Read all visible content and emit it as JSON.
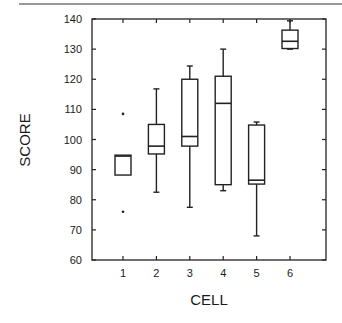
{
  "chart_data": {
    "type": "box",
    "title": "",
    "xlabel": "CELL",
    "ylabel": "SCORE",
    "ylim": [
      60,
      140
    ],
    "xlim": [
      0.3,
      7
    ],
    "yticks": [
      60,
      70,
      80,
      90,
      100,
      110,
      120,
      130,
      140
    ],
    "xticks": [
      1,
      2,
      3,
      4,
      5,
      6
    ],
    "grid": false,
    "legend": null,
    "categories": [
      "1",
      "2",
      "3",
      "4",
      "5",
      "6"
    ],
    "boxes": [
      {
        "x": 1,
        "whisker_low": null,
        "q1": 88.2,
        "median": 94.5,
        "q3": 94.8,
        "whisker_high": null,
        "outliers": [
          108.5,
          76
        ]
      },
      {
        "x": 2,
        "whisker_low": 82.5,
        "q1": 95.2,
        "median": 97.8,
        "q3": 105,
        "whisker_high": 116.8,
        "outliers": []
      },
      {
        "x": 3,
        "whisker_low": 77.5,
        "q1": 97.8,
        "median": 101,
        "q3": 120,
        "whisker_high": 124.4,
        "outliers": []
      },
      {
        "x": 4,
        "whisker_low": 83,
        "q1": 85,
        "median": 112,
        "q3": 121,
        "whisker_high": 130,
        "outliers": []
      },
      {
        "x": 5,
        "whisker_low": 68,
        "q1": 85.2,
        "median": 86.5,
        "q3": 104.8,
        "whisker_high": 105.8,
        "outliers": []
      },
      {
        "x": 6,
        "whisker_low": 130,
        "q1": 130.2,
        "median": 132.6,
        "q3": 136.3,
        "whisker_high": 139.4,
        "outliers": []
      }
    ]
  },
  "axes": {
    "xlabel": "CELL",
    "ylabel": "SCORE"
  }
}
